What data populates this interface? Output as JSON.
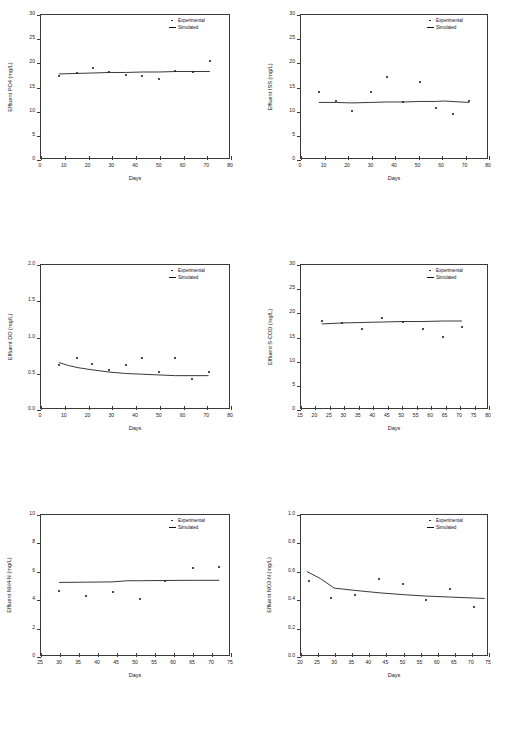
{
  "figure": {
    "layout": "2 columns x 3 rows of scatter/line plots",
    "legend_labels": {
      "experimental": "Experimental",
      "simulated": "Simulated"
    },
    "legend_position": "top-right inside plot"
  },
  "chart_data": [
    {
      "id": "effluent-po4",
      "type": "scatter",
      "title": "",
      "xlabel": "Days",
      "ylabel": "Effluent  PO4  (mg/L)",
      "xlim": [
        0,
        80
      ],
      "ylim": [
        0,
        30
      ],
      "xticks": [
        0,
        10,
        20,
        30,
        40,
        50,
        60,
        70,
        80
      ],
      "yticks": [
        0,
        5,
        10,
        15,
        20,
        25,
        30
      ],
      "xticklabels": [
        "0",
        "10",
        "20",
        "30",
        "40",
        "50",
        "60",
        "70",
        "80"
      ],
      "yticklabels": [
        "0",
        "5",
        "10",
        "15",
        "20",
        "25",
        "30"
      ],
      "grid": false,
      "series": [
        {
          "name": "Experimental",
          "style": "points",
          "x": [
            8,
            15.5,
            22.5,
            29,
            36,
            43,
            50,
            57,
            64.5,
            71.5
          ],
          "y": [
            17.1,
            17.8,
            18.8,
            18.1,
            17.4,
            17.1,
            16.5,
            18.2,
            18.0,
            20.2
          ]
        },
        {
          "name": "Simulated",
          "style": "line",
          "x": [
            8,
            15.5,
            22.5,
            29,
            36,
            43,
            50,
            57,
            64.5,
            71.5
          ],
          "y": [
            17.6,
            17.7,
            17.8,
            17.9,
            17.9,
            18.0,
            18.0,
            18.1,
            18.1,
            18.1
          ]
        }
      ]
    },
    {
      "id": "effluent-iss",
      "type": "scatter",
      "title": "",
      "xlabel": "Days",
      "ylabel": "Effluent  ISS  (mg/L)",
      "xlim": [
        0,
        80
      ],
      "ylim": [
        0,
        30
      ],
      "xticks": [
        0,
        10,
        20,
        30,
        40,
        50,
        60,
        70,
        80
      ],
      "yticks": [
        0,
        5,
        10,
        15,
        20,
        25,
        30
      ],
      "xticklabels": [
        "0",
        "10",
        "20",
        "30",
        "40",
        "50",
        "60",
        "70",
        "80"
      ],
      "yticklabels": [
        "0",
        "5",
        "10",
        "15",
        "20",
        "25",
        "30"
      ],
      "grid": false,
      "series": [
        {
          "name": "Experimental",
          "style": "points",
          "x": [
            8,
            15.5,
            22,
            30,
            37,
            44,
            51,
            58,
            65,
            72
          ],
          "y": [
            13.9,
            12.0,
            10.0,
            13.9,
            17.0,
            11.8,
            15.9,
            10.5,
            9.4,
            11.9
          ]
        },
        {
          "name": "Simulated",
          "style": "line",
          "x": [
            8,
            15.5,
            22,
            30,
            37,
            44,
            51,
            58,
            61,
            72
          ],
          "y": [
            11.7,
            11.7,
            11.6,
            11.7,
            11.8,
            11.8,
            11.9,
            11.9,
            12.0,
            11.7
          ]
        }
      ]
    },
    {
      "id": "effluent-do",
      "type": "scatter",
      "title": "",
      "xlabel": "Days",
      "ylabel": "Effluent  DO  (mg/L)",
      "xlim": [
        0,
        80
      ],
      "ylim": [
        0.0,
        2.0
      ],
      "xticks": [
        0,
        10,
        20,
        30,
        40,
        50,
        60,
        70,
        80
      ],
      "yticks": [
        0.0,
        0.5,
        1.0,
        1.5,
        2.0
      ],
      "xticklabels": [
        "0",
        "10",
        "20",
        "30",
        "40",
        "50",
        "60",
        "70",
        "80"
      ],
      "yticklabels": [
        "0.0",
        "0.5",
        "1.0",
        "1.5",
        "2.0"
      ],
      "grid": false,
      "series": [
        {
          "name": "Experimental",
          "style": "points",
          "x": [
            8,
            15.5,
            22,
            29,
            36,
            43,
            50,
            57,
            64,
            71
          ],
          "y": [
            0.61,
            0.7,
            0.62,
            0.54,
            0.61,
            0.7,
            0.51,
            0.7,
            0.42,
            0.51
          ]
        },
        {
          "name": "Simulated",
          "style": "line",
          "x": [
            8,
            12,
            16,
            22,
            29,
            36,
            43,
            50,
            57,
            64,
            71
          ],
          "y": [
            0.64,
            0.6,
            0.57,
            0.54,
            0.51,
            0.49,
            0.48,
            0.47,
            0.46,
            0.46,
            0.46
          ]
        }
      ]
    },
    {
      "id": "effluent-scod",
      "type": "scatter",
      "title": "",
      "xlabel": "Days",
      "ylabel": "Effluent  S-COD  (mg/L)",
      "xlim": [
        15,
        80
      ],
      "ylim": [
        0,
        30
      ],
      "xticks": [
        15,
        20,
        25,
        30,
        35,
        40,
        45,
        50,
        55,
        60,
        65,
        70,
        75,
        80
      ],
      "yticks": [
        0,
        5,
        10,
        15,
        20,
        25,
        30
      ],
      "xticklabels": [
        "15",
        "20",
        "25",
        "30",
        "35",
        "40",
        "45",
        "50",
        "55",
        "60",
        "65",
        "70",
        "75",
        "80"
      ],
      "yticklabels": [
        "0",
        "5",
        "10",
        "15",
        "20",
        "25",
        "30"
      ],
      "grid": false,
      "series": [
        {
          "name": "Experimental",
          "style": "points",
          "x": [
            22.5,
            29.5,
            36.5,
            43.5,
            50.5,
            57.5,
            64.5,
            71
          ],
          "y": [
            18.2,
            17.7,
            16.6,
            18.8,
            18.1,
            16.6,
            14.9,
            17.0
          ]
        },
        {
          "name": "Simulated",
          "style": "line",
          "x": [
            22.5,
            29.5,
            36.5,
            43.5,
            50.5,
            57.5,
            64.5,
            71
          ],
          "y": [
            17.6,
            17.8,
            17.9,
            18.0,
            18.1,
            18.1,
            18.2,
            18.2
          ]
        }
      ]
    },
    {
      "id": "effluent-nh4n",
      "type": "scatter",
      "title": "",
      "xlabel": "Days",
      "ylabel": "Effluent  NH4-N  (mg/L)",
      "xlim": [
        25,
        75
      ],
      "ylim": [
        0,
        10
      ],
      "xticks": [
        25,
        30,
        35,
        40,
        45,
        50,
        55,
        60,
        65,
        70,
        75
      ],
      "yticks": [
        0,
        2,
        4,
        6,
        8,
        10
      ],
      "xticklabels": [
        "25",
        "30",
        "35",
        "40",
        "45",
        "50",
        "55",
        "60",
        "65",
        "70",
        "75"
      ],
      "yticklabels": [
        "0",
        "2",
        "4",
        "6",
        "8",
        "10"
      ],
      "grid": false,
      "series": [
        {
          "name": "Experimental",
          "style": "points",
          "x": [
            30,
            37.2,
            44.2,
            51.2,
            58,
            65.2,
            72.2
          ],
          "y": [
            4.55,
            4.22,
            4.48,
            4.0,
            5.3,
            6.2,
            6.25
          ]
        },
        {
          "name": "Simulated",
          "style": "line",
          "x": [
            30,
            37.2,
            44.2,
            48,
            51.2,
            58,
            65.2,
            72.2
          ],
          "y": [
            5.18,
            5.2,
            5.22,
            5.3,
            5.3,
            5.32,
            5.33,
            5.33
          ]
        }
      ]
    },
    {
      "id": "effluent-no3n",
      "type": "scatter",
      "title": "",
      "xlabel": "Days",
      "ylabel": "Effluent  NO3-N  (mg/L)",
      "xlim": [
        20,
        75
      ],
      "ylim": [
        0.0,
        1.0
      ],
      "xticks": [
        20,
        25,
        30,
        35,
        40,
        45,
        50,
        55,
        60,
        65,
        70,
        75
      ],
      "yticks": [
        0.0,
        0.2,
        0.4,
        0.6,
        0.8,
        1.0
      ],
      "xticklabels": [
        "20",
        "25",
        "30",
        "35",
        "40",
        "45",
        "50",
        "55",
        "60",
        "65",
        "70",
        "75"
      ],
      "yticklabels": [
        "0.0",
        "0.2",
        "0.4",
        "0.6",
        "0.8",
        "1.0"
      ],
      "grid": false,
      "series": [
        {
          "name": "Experimental",
          "style": "points",
          "x": [
            22.5,
            29.2,
            36,
            43.2,
            50.2,
            57,
            64,
            71
          ],
          "y": [
            0.53,
            0.41,
            0.43,
            0.54,
            0.51,
            0.395,
            0.47,
            0.345
          ]
        },
        {
          "name": "Simulated",
          "style": "line",
          "x": [
            22,
            26,
            30,
            36,
            43.2,
            50.2,
            57,
            64,
            71,
            74
          ],
          "y": [
            0.595,
            0.545,
            0.478,
            0.462,
            0.445,
            0.432,
            0.422,
            0.415,
            0.408,
            0.405
          ]
        }
      ]
    }
  ]
}
